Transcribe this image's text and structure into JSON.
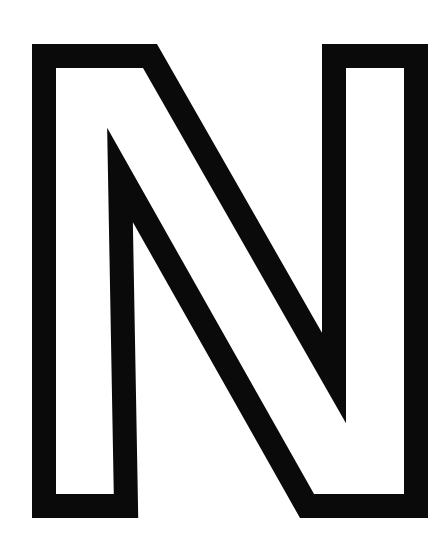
{
  "figure": {
    "letter": "N",
    "style": "outlined",
    "stroke_color": "#0a0a0a",
    "fill_color": "#ffffff",
    "background": "#ffffff",
    "stroke_width": 24
  }
}
